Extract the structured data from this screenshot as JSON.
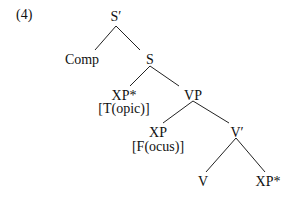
{
  "example_number": "(4)",
  "tree": {
    "root": {
      "label": "S′"
    },
    "comp": {
      "label": "Comp"
    },
    "s": {
      "label": "S"
    },
    "xp_topic": {
      "label": "XP*",
      "feature": "[T(opic)]"
    },
    "vp": {
      "label": "VP"
    },
    "xp_focus": {
      "label": "XP",
      "feature": "[F(ocus)]"
    },
    "v_bar": {
      "label": "V′"
    },
    "v": {
      "label": "V"
    },
    "xp_object": {
      "label": "XP*"
    }
  }
}
